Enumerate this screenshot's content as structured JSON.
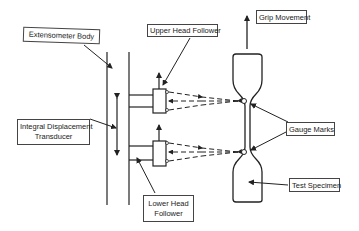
{
  "diagram": {
    "labels": {
      "extensometer_body": "Extensometer Body",
      "upper_head_follower": "Upper Head Follower",
      "grip_movement": "Grip Movement",
      "integral_displacement_transducer_line1": "Integral Displacement",
      "integral_displacement_transducer_line2": "Transducer",
      "lower_head_follower_line1": "Lower Head",
      "lower_head_follower_line2": "Follower",
      "gauge_marks": "Gauge Marks",
      "test_specimen": "Test Specimen"
    },
    "colors": {
      "line": "#222222",
      "label_border": "#444444",
      "background": "#ffffff"
    }
  }
}
